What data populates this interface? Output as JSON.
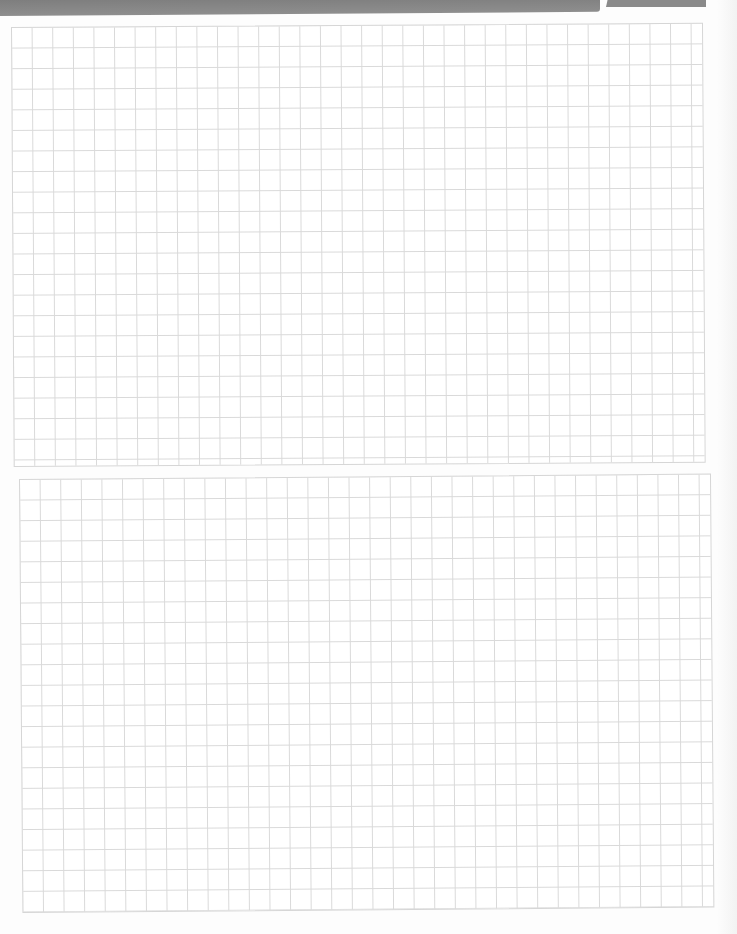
{
  "page": {
    "type": "graph-paper-scan",
    "background_color": "#fdfdfd",
    "header_band_color": "#808080",
    "grid_line_color": "#d9d9d9"
  },
  "grids": [
    {
      "name": "top-grid",
      "columns": 34,
      "rows": 21,
      "cell_size_px": 20.6
    },
    {
      "name": "bottom-grid",
      "columns": 34,
      "rows": 21,
      "cell_size_px": 20.6
    }
  ]
}
